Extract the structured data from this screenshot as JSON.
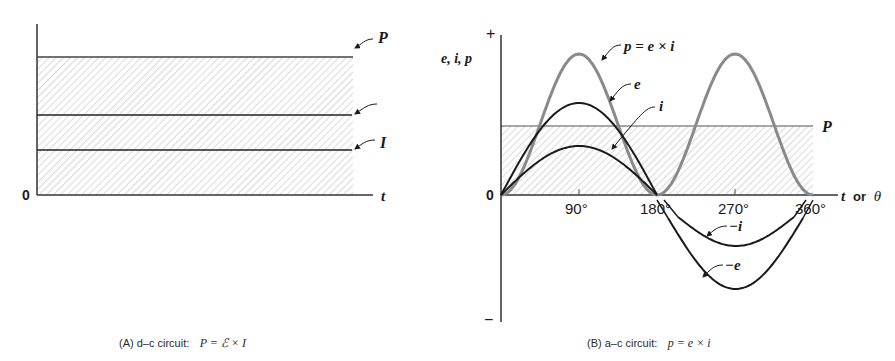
{
  "chart_data": [
    {
      "id": "A",
      "type": "line",
      "title": "(A) d-c circuit:",
      "caption_formula": "P = ℰ × I",
      "xlabel": "t",
      "ylabel": "",
      "origin_label": "0",
      "series": [
        {
          "name": "P",
          "label": "P",
          "constant_value": 138,
          "shaded": true
        },
        {
          "name": "E",
          "label": "",
          "constant_value": 80
        },
        {
          "name": "I",
          "label": "I",
          "constant_value": 45
        }
      ],
      "notes": "Constant (flat) lines; area under P is hatched to represent power/energy."
    },
    {
      "id": "B",
      "type": "line",
      "title": "(B) a-c circuit:",
      "caption_formula": "p = e × i",
      "xlabel": "t or θ",
      "ylabel": "e, i, p",
      "y_plus_label": "+",
      "y_minus_label": "−",
      "origin_label": "0",
      "x_ticks": [
        "90°",
        "180°",
        "270°",
        "360°"
      ],
      "x_tick_degrees": [
        90,
        180,
        270,
        360
      ],
      "xlim": [
        0,
        360
      ],
      "series": [
        {
          "name": "p",
          "label": "p = e × i",
          "kind": "sin^2",
          "amplitude": 141,
          "color": "#8a8a8a"
        },
        {
          "name": "e",
          "label": "e",
          "kind": "sin",
          "amplitude": 92,
          "range": [
            0,
            180
          ],
          "color": "#1a1a1a"
        },
        {
          "name": "i",
          "label": "i",
          "kind": "sin",
          "amplitude": 49,
          "range": [
            0,
            180
          ],
          "color": "#1a1a1a"
        },
        {
          "name": "-e",
          "label": "−e",
          "kind": "neg-lobe",
          "amplitude": 92,
          "range": [
            180,
            360
          ],
          "color": "#1a1a1a"
        },
        {
          "name": "-i",
          "label": "−i",
          "kind": "neg-lobe",
          "amplitude": 49,
          "range": [
            180,
            360
          ],
          "color": "#1a1a1a"
        },
        {
          "name": "P",
          "label": "P",
          "kind": "constant",
          "constant_value": 69,
          "shaded": true,
          "color": "#8a8a8a"
        }
      ],
      "notes": "Power p is always positive (double frequency); average power P is half of peak p."
    }
  ],
  "figure": {
    "panel_a": {
      "caption_prefix": "(A)  d–c circuit:",
      "caption_formula": "P = ℰ × I",
      "xlabel": "t",
      "origin": "0",
      "labels": {
        "P": "P",
        "I": "I"
      }
    },
    "panel_b": {
      "caption_prefix": "(B)  a–c circuit:",
      "caption_formula": "p = e × i",
      "ylabel": "e, i, p",
      "plus": "+",
      "minus": "−",
      "origin": "0",
      "xlabel_t": "t",
      "xlabel_or": " or ",
      "xlabel_theta": "θ",
      "ticks": [
        "90°",
        "180°",
        "270°",
        "360°"
      ],
      "labels": {
        "p": "p = e × i",
        "e": "e",
        "i": "i",
        "neg_e": "−e",
        "neg_i": "−i",
        "P": "P"
      }
    }
  }
}
